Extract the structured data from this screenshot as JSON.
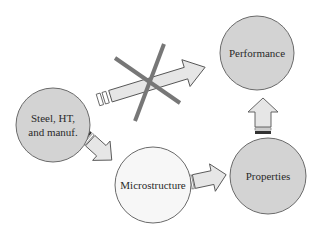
{
  "diagram": {
    "type": "flow",
    "colors": {
      "background": "#ffffff",
      "node_fill_gray": "#d3d3d3",
      "node_fill_light": "#f7f7f7",
      "node_stroke": "#6a6a6a",
      "arrow_fill": "#e6e6e6",
      "arrow_stroke": "#555555",
      "cross_stroke": "#777777"
    },
    "nodes": [
      {
        "id": "steel",
        "lines": [
          "Steel, HT,",
          "and manuf."
        ],
        "fill": "gray"
      },
      {
        "id": "performance",
        "lines": [
          "Performance"
        ],
        "fill": "gray"
      },
      {
        "id": "microstructure",
        "lines": [
          "Microstructure"
        ],
        "fill": "light"
      },
      {
        "id": "properties",
        "lines": [
          "Properties"
        ],
        "fill": "gray"
      }
    ],
    "edges": [
      {
        "from": "steel",
        "to": "performance",
        "crossed_out": true
      },
      {
        "from": "steel",
        "to": "microstructure",
        "crossed_out": false
      },
      {
        "from": "microstructure",
        "to": "properties",
        "crossed_out": false
      },
      {
        "from": "properties",
        "to": "performance",
        "crossed_out": false
      }
    ]
  }
}
